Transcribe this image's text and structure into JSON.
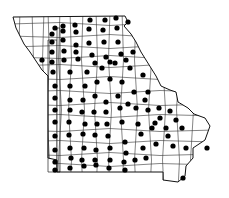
{
  "map": {
    "title": "",
    "region": "Missouri county distribution map",
    "colors": {
      "background": "#ffffff",
      "lines": "#222222",
      "dots": "#000000"
    },
    "outline": "13,17 125,16 128,22 124,26 131,34 136,42 141,52 146,60 151,68 156,76 161,86 170,90 176,92 178,102 188,108 194,114 205,118 210,126 205,140 193,148 193,158 186,166 185,176 178,182 163,180 163,172 57,172 57,160 48,158 48,76 42,70 38,64 34,58 30,52 24,44 20,36 16,28",
    "dots": [
      [
        55,
        28
      ],
      [
        63,
        26
      ],
      [
        75,
        25
      ],
      [
        90,
        20
      ],
      [
        105,
        20
      ],
      [
        116,
        18
      ],
      [
        52,
        34
      ],
      [
        63,
        31
      ],
      [
        76,
        32
      ],
      [
        89,
        29
      ],
      [
        103,
        30
      ],
      [
        117,
        28
      ],
      [
        128,
        22
      ],
      [
        52,
        42
      ],
      [
        63,
        40
      ],
      [
        76,
        45
      ],
      [
        89,
        43
      ],
      [
        104,
        42
      ],
      [
        118,
        42
      ],
      [
        52,
        52
      ],
      [
        64,
        51
      ],
      [
        76,
        52
      ],
      [
        92,
        55
      ],
      [
        106,
        57
      ],
      [
        121,
        54
      ],
      [
        133,
        52
      ],
      [
        42,
        60
      ],
      [
        52,
        62
      ],
      [
        64,
        60
      ],
      [
        78,
        59
      ],
      [
        95,
        63
      ],
      [
        110,
        62
      ],
      [
        126,
        60
      ],
      [
        53,
        72
      ],
      [
        70,
        72
      ],
      [
        87,
        72
      ],
      [
        102,
        68
      ],
      [
        115,
        63
      ],
      [
        130,
        68
      ],
      [
        143,
        75
      ],
      [
        55,
        86
      ],
      [
        70,
        86
      ],
      [
        85,
        86
      ],
      [
        97,
        82
      ],
      [
        110,
        79
      ],
      [
        122,
        82
      ],
      [
        134,
        92
      ],
      [
        148,
        92
      ],
      [
        55,
        98
      ],
      [
        70,
        100
      ],
      [
        83,
        100
      ],
      [
        95,
        96
      ],
      [
        106,
        102
      ],
      [
        118,
        96
      ],
      [
        128,
        104
      ],
      [
        145,
        100
      ],
      [
        159,
        108
      ],
      [
        55,
        110
      ],
      [
        70,
        110
      ],
      [
        82,
        112
      ],
      [
        94,
        112
      ],
      [
        106,
        112
      ],
      [
        120,
        108
      ],
      [
        136,
        108
      ],
      [
        148,
        110
      ],
      [
        160,
        118
      ],
      [
        170,
        111
      ],
      [
        55,
        122
      ],
      [
        69,
        122
      ],
      [
        85,
        124
      ],
      [
        97,
        124
      ],
      [
        107,
        124
      ],
      [
        122,
        122
      ],
      [
        138,
        124
      ],
      [
        155,
        123
      ],
      [
        166,
        128
      ],
      [
        176,
        120
      ],
      [
        55,
        136
      ],
      [
        69,
        135
      ],
      [
        83,
        134
      ],
      [
        95,
        135
      ],
      [
        108,
        136
      ],
      [
        125,
        142
      ],
      [
        141,
        134
      ],
      [
        152,
        128
      ],
      [
        168,
        136
      ],
      [
        182,
        128
      ],
      [
        55,
        150
      ],
      [
        70,
        148
      ],
      [
        84,
        148
      ],
      [
        96,
        150
      ],
      [
        110,
        148
      ],
      [
        126,
        153
      ],
      [
        143,
        148
      ],
      [
        156,
        144
      ],
      [
        173,
        146
      ],
      [
        186,
        148
      ],
      [
        207,
        148
      ],
      [
        55,
        162
      ],
      [
        71,
        158
      ],
      [
        82,
        160
      ],
      [
        95,
        160
      ],
      [
        110,
        160
      ],
      [
        124,
        162
      ],
      [
        135,
        160
      ],
      [
        146,
        158
      ],
      [
        55,
        170
      ],
      [
        70,
        168
      ],
      [
        84,
        166
      ],
      [
        96,
        165
      ],
      [
        109,
        168
      ],
      [
        125,
        170
      ],
      [
        183,
        178
      ]
    ]
  }
}
